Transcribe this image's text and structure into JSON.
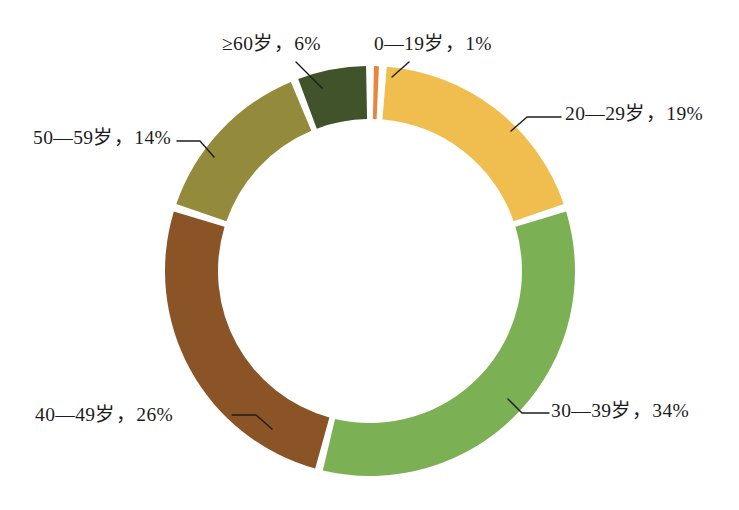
{
  "chart_data": {
    "type": "pie",
    "variant": "donut",
    "title": "",
    "subtitle": "",
    "xlabel": "",
    "ylabel": "",
    "legend_position": "none",
    "grid": false,
    "units": "%",
    "start_angle_deg": 0,
    "direction": "clockwise",
    "categories": [
      "0—19岁",
      "20—29岁",
      "30—39岁",
      "40—49岁",
      "50—59岁",
      "≥60岁"
    ],
    "values": [
      1,
      19,
      34,
      26,
      14,
      6
    ],
    "colors": [
      "#E8863C",
      "#EFBE4E",
      "#7CB055",
      "#8A5426",
      "#948A3C",
      "#41532A"
    ],
    "labels": [
      "0—19岁，1%",
      "20—29岁，19%",
      "30—39岁，34%",
      "40—49岁，26%",
      "50—59岁，14%",
      "≥60岁，6%"
    ],
    "slices": [
      {
        "name": "0—19岁",
        "value": 1,
        "label": "0—19岁，1%",
        "color": "#E8863C"
      },
      {
        "name": "20—29岁",
        "value": 19,
        "label": "20—29岁，19%",
        "color": "#EFBE4E"
      },
      {
        "name": "30—39岁",
        "value": 34,
        "label": "30—39岁，34%",
        "color": "#7CB055"
      },
      {
        "name": "40—49岁",
        "value": 26,
        "label": "40—49岁，26%",
        "color": "#8A5426"
      },
      {
        "name": "50—59岁",
        "value": 14,
        "label": "50—59岁，14%",
        "color": "#948A3C"
      },
      {
        "name": "≥60岁",
        "value": 6,
        "label": "≥60岁，6%",
        "color": "#41532A"
      }
    ]
  },
  "geometry": {
    "center_x": 370,
    "center_y": 271,
    "outer_radius": 205,
    "inner_radius": 152,
    "gap_degrees": 2.2
  },
  "leader_lines": [
    {
      "name": "0—19岁",
      "points": "409,62 392,77"
    },
    {
      "name": "20—29岁",
      "points": "561,117 527,117 511,131"
    },
    {
      "name": "30—39岁",
      "points": "549,413 522,413 508,399"
    },
    {
      "name": "40—49岁",
      "points": "232,415 256,415 272,429"
    },
    {
      "name": "50—59岁",
      "points": "177,141 200,141 214,157"
    },
    {
      "name": "≥60岁",
      "points": "296,62 322,88"
    }
  ],
  "canvas": {
    "width": 739,
    "height": 510,
    "background": "#ffffff"
  }
}
